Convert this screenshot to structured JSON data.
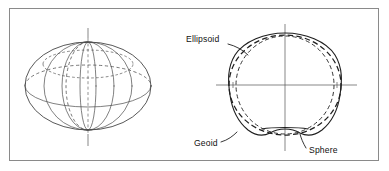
{
  "figure": {
    "frame": {
      "border_color": "#8a8a8a",
      "background_color": "#ffffff"
    },
    "panels": [
      {
        "id": "left-panel",
        "name": "ellipsoid-wireframe",
        "description": "Oblate ellipsoid drawn as a wireframe globe with meridians, an equator and a polar axis"
      },
      {
        "id": "right-panel",
        "name": "geoid-comparison",
        "description": "Cross-section comparing the geoid outline with an ellipsoid and a sphere"
      }
    ],
    "labels": [
      {
        "key": "ellipsoid",
        "text": "Ellipsoid",
        "x": 186,
        "y": 41,
        "anchor": "start",
        "line_style": "dashed-heavy"
      },
      {
        "key": "geoid",
        "text": "Geoid",
        "x": 194,
        "y": 145,
        "anchor": "start",
        "line_style": "solid"
      },
      {
        "key": "sphere",
        "text": "Sphere",
        "x": 308,
        "y": 152,
        "anchor": "start",
        "line_style": "dashed-fine"
      }
    ],
    "legend_semantics": {
      "geoid_line": "solid",
      "ellipsoid_line": "long-dashed",
      "sphere_line": "short-dashed"
    },
    "colors": {
      "ink": "#1f1f1f",
      "line_gray": "#4a4a4a",
      "axis_gray": "#555555",
      "frame": "#8a8a8a",
      "background": "#ffffff"
    }
  }
}
